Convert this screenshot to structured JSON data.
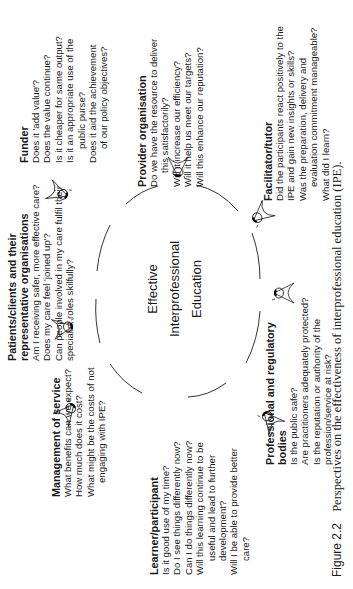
{
  "figure": {
    "center_label": [
      "Effective",
      "Interprofessional",
      "Education"
    ],
    "caption_label": "Figure 2.2",
    "caption_text": "Perspectives on the effectiveness of interprofessional education (IPE)."
  },
  "perspectives": [
    {
      "id": "funder",
      "title": "Funder",
      "lines": [
        {
          "text": "Does it 'add value'?",
          "indent": false
        },
        {
          "text": "Does the value continue?",
          "indent": false
        },
        {
          "text": "Is it cheaper for same output?",
          "indent": false
        },
        {
          "text": "Is it an appropriate use of the",
          "indent": false
        },
        {
          "text": "public purse?",
          "indent": true
        },
        {
          "text": "Does it aid the achievement",
          "indent": false
        },
        {
          "text": "of our policy objectives?",
          "indent": true
        }
      ]
    },
    {
      "id": "provider",
      "title": "Provider organisation",
      "lines": [
        {
          "text": "Do we have the resource to deliver",
          "indent": false
        },
        {
          "text": "this satisfactorily?",
          "indent": true
        },
        {
          "text": "Will it increase our efficiency?",
          "indent": false
        },
        {
          "text": "Will it help us meet our targets?",
          "indent": false
        },
        {
          "text": "Will this enhance our reputation?",
          "indent": false
        }
      ]
    },
    {
      "id": "facilitator",
      "title": "Facilitator/tutor",
      "lines": [
        {
          "text": "Did the participants react positively to the",
          "indent": false
        },
        {
          "text": "IPE and gain new insights or skills?",
          "indent": false
        },
        {
          "text": "Was the preparation, delivery and",
          "indent": false
        },
        {
          "text": "evaluation commitment manageable?",
          "indent": true
        },
        {
          "text": "What did I learn?",
          "indent": false
        }
      ]
    },
    {
      "id": "patients",
      "title_lines": [
        "Patients/clients and their",
        "representative organisations"
      ],
      "lines": [
        {
          "text": "Am I receiving safer, more effective care?",
          "indent": false
        },
        {
          "text": "Does my care feel 'joined up'?",
          "indent": false
        },
        {
          "text": "Can people involved in my care fulfil their",
          "indent": false
        },
        {
          "text": "specialist roles skilfully?",
          "indent": false
        }
      ]
    },
    {
      "id": "management",
      "title": "Management of service",
      "lines": [
        {
          "text": "What benefits can we expect?",
          "indent": false
        },
        {
          "text": "How much does it cost?",
          "indent": false
        },
        {
          "text": "What might be the costs of not",
          "indent": false
        },
        {
          "text": "engaging with IPE?",
          "indent": true
        }
      ]
    },
    {
      "id": "learner",
      "title": "Learner/participant",
      "lines": [
        {
          "text": "Is it good use of my time?",
          "indent": false
        },
        {
          "text": "Do I see things differently now?",
          "indent": false
        },
        {
          "text": "Can I do things differently now?",
          "indent": false
        },
        {
          "text": "Will this learning continue to be",
          "indent": false
        },
        {
          "text": "useful and lead to further",
          "indent": true
        },
        {
          "text": "development?",
          "indent": true
        },
        {
          "text": "Will I be able to provide better",
          "indent": false
        },
        {
          "text": "care?",
          "indent": true
        }
      ]
    },
    {
      "id": "professional",
      "title_lines": [
        "Professional and  regulatory",
        "bodies"
      ],
      "lines": [
        {
          "text": "Is the public safe?",
          "indent": false
        },
        {
          "text": "Are practitioners adequately protected?",
          "indent": false
        },
        {
          "text": "Is the reputation or authority of the",
          "indent": false
        },
        {
          "text": "profession/service at risk?",
          "indent": false
        }
      ]
    }
  ],
  "icons": {
    "eye": "eye-icon",
    "count": 7
  }
}
